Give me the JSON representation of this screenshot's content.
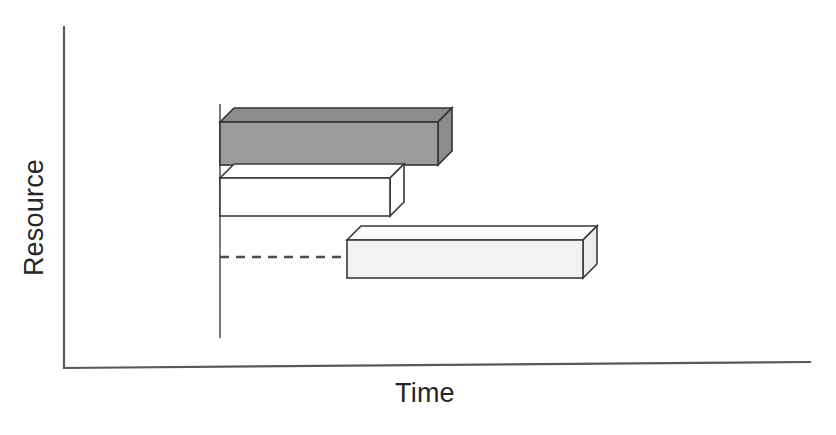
{
  "figure": {
    "background_color": "#ffffff",
    "line_color": "#4d4d4d",
    "axis_color": "#555555"
  },
  "axes": {
    "y_axis_label": "Resource",
    "x_axis_label": "Time",
    "y_axis_name": "vertical-axis-line",
    "x_axis_name": "horizontal-axis-line"
  },
  "reference_line": {
    "name": "project-start-reference-line",
    "x": 220,
    "y_top": 104,
    "y_bottom": 338,
    "color": "#6b6b6b"
  },
  "connector": {
    "name": "lag-dashed-connector",
    "x_start": 220,
    "x_end": 347,
    "y": 257,
    "color": "#4d4d4d",
    "dash_pattern": "9 7"
  },
  "chart_data": {
    "type": "bar",
    "orientation": "horizontal",
    "title": "",
    "xlabel": "Time",
    "ylabel": "Resource",
    "grid": false,
    "legend": false,
    "axis_ticks": false,
    "xlim": [
      220,
      810
    ],
    "categories": [
      "Task 1",
      "Task 2",
      "Task 3"
    ],
    "bars": [
      {
        "label": "Task 1",
        "start": 220,
        "end": 438,
        "duration": 218,
        "top": 122,
        "bottom": 165,
        "depth_x": 14,
        "depth_y": -14,
        "fill": "#9b9b9b",
        "top_face_fill": "#8c8c8c",
        "side_face_fill": "#8c8c8c",
        "stroke": "#333333",
        "style": "shaded-dark"
      },
      {
        "label": "Task 2",
        "start": 220,
        "end": 390,
        "duration": 170,
        "top": 178,
        "bottom": 216,
        "depth_x": 14,
        "depth_y": -14,
        "fill": "#ffffff",
        "top_face_fill": "#ffffff",
        "side_face_fill": "#ffffff",
        "stroke": "#3a3a3a",
        "style": "outline-white"
      },
      {
        "label": "Task 3",
        "start": 347,
        "end": 583,
        "duration": 236,
        "top": 240,
        "bottom": 278,
        "depth_x": 14,
        "depth_y": -14,
        "fill": "#f2f2f2",
        "top_face_fill": "#fbfbfb",
        "side_face_fill": "#ededed",
        "stroke": "#3a3a3a",
        "style": "outline-light"
      }
    ]
  }
}
